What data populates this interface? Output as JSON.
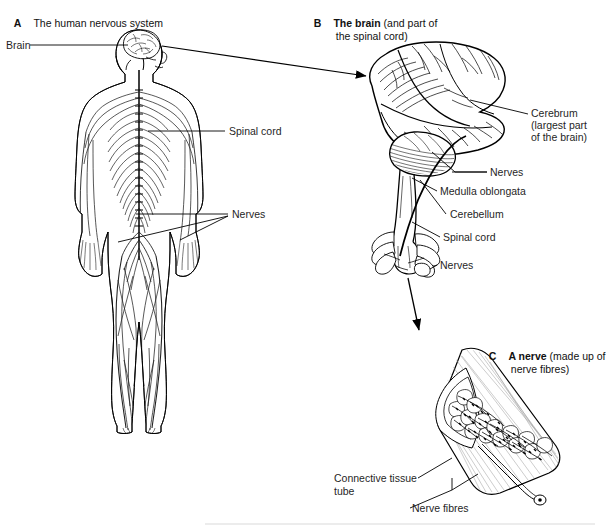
{
  "figure": {
    "panels": [
      {
        "letter": "A",
        "title": "The human nervous system",
        "paren": "",
        "labels": [
          {
            "name": "brain",
            "text": "Brain"
          },
          {
            "name": "spinal-cord",
            "text": "Spinal cord"
          },
          {
            "name": "nerves",
            "text": "Nerves"
          }
        ]
      },
      {
        "letter": "B",
        "title": "The brain",
        "paren_line1": " (and part of",
        "paren_line2": "the spinal cord)",
        "labels": [
          {
            "name": "cerebrum",
            "text": "Cerebrum"
          },
          {
            "name": "cerebrum-note-1",
            "text": "(largest part"
          },
          {
            "name": "cerebrum-note-2",
            "text": "of the brain)"
          },
          {
            "name": "nerves-upper",
            "text": "Nerves"
          },
          {
            "name": "medulla-oblongata",
            "text": "Medulla oblongata"
          },
          {
            "name": "cerebellum",
            "text": "Cerebellum"
          },
          {
            "name": "spinal-cord",
            "text": "Spinal cord"
          },
          {
            "name": "nerves-lower",
            "text": "Nerves"
          }
        ]
      },
      {
        "letter": "C",
        "title": "A nerve",
        "paren_line1": " (made up of",
        "paren_line2": "nerve fibres)",
        "labels": [
          {
            "name": "connective-tissue-tube-1",
            "text": "Connective tissue"
          },
          {
            "name": "connective-tissue-tube-2",
            "text": "tube"
          },
          {
            "name": "nerve-fibres",
            "text": "Nerve fibres"
          }
        ]
      }
    ],
    "colors": {
      "ink": "#1a1a1a",
      "line": "#000000",
      "paper": "#ffffff",
      "shade": "#9a9a9a"
    }
  }
}
